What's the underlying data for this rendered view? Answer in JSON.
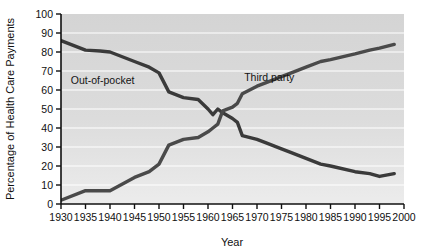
{
  "chart_data": {
    "type": "line",
    "title": "",
    "xlabel": "Year",
    "ylabel": "Percentage of Health Care Payments",
    "xlim": [
      1930,
      2000
    ],
    "ylim": [
      0,
      100
    ],
    "grid": true,
    "grid_axis": "y",
    "legend_position": "inline-annotations",
    "x_tick_labels": [
      "1930",
      "1935",
      "1940",
      "1945",
      "1950",
      "1955",
      "1960",
      "1965",
      "1970",
      "1975",
      "1980",
      "1985",
      "1990",
      "1995",
      "2000"
    ],
    "x_ticks": [
      1930,
      1935,
      1940,
      1945,
      1950,
      1955,
      1960,
      1965,
      1970,
      1975,
      1980,
      1985,
      1990,
      1995,
      2000
    ],
    "y_tick_labels": [
      "0",
      "10",
      "20",
      "30",
      "40",
      "50",
      "60",
      "70",
      "80",
      "90",
      "100"
    ],
    "y_ticks": [
      0,
      10,
      20,
      30,
      40,
      50,
      60,
      70,
      80,
      90,
      100
    ],
    "series": [
      {
        "name": "Out-of-pocket",
        "label": "Out-of-pocket",
        "color": "#3a3a3a",
        "x": [
          1930,
          1935,
          1938,
          1940,
          1945,
          1948,
          1950,
          1952,
          1955,
          1958,
          1960,
          1961,
          1962,
          1963,
          1965,
          1966,
          1967,
          1970,
          1972,
          1975,
          1977,
          1980,
          1983,
          1985,
          1990,
          1993,
          1995,
          1998
        ],
        "values": [
          86,
          81,
          80.5,
          80,
          75,
          72,
          69,
          59,
          56,
          55,
          50,
          47,
          50,
          48,
          45,
          43,
          36,
          34,
          32,
          29,
          27,
          24,
          21,
          20,
          17,
          16,
          14.5,
          16
        ]
      },
      {
        "name": "Third party",
        "label": "Third party",
        "color": "#4a4a4a",
        "x": [
          1930,
          1935,
          1938,
          1940,
          1945,
          1948,
          1950,
          1952,
          1955,
          1958,
          1960,
          1961,
          1962,
          1963,
          1965,
          1966,
          1967,
          1970,
          1972,
          1975,
          1977,
          1980,
          1983,
          1985,
          1990,
          1993,
          1995,
          1998
        ],
        "values": [
          2,
          7,
          7,
          7,
          14,
          17,
          21,
          31,
          34,
          35,
          38,
          40,
          42,
          49,
          51,
          53,
          58,
          62,
          64,
          67,
          69,
          72,
          75,
          76,
          79,
          81,
          82,
          84
        ]
      }
    ],
    "annotations": [
      {
        "text": "Out-of-pocket",
        "x": 1938.5,
        "y": 63
      },
      {
        "text": "Third party",
        "x": 1972.5,
        "y": 65
      }
    ]
  }
}
